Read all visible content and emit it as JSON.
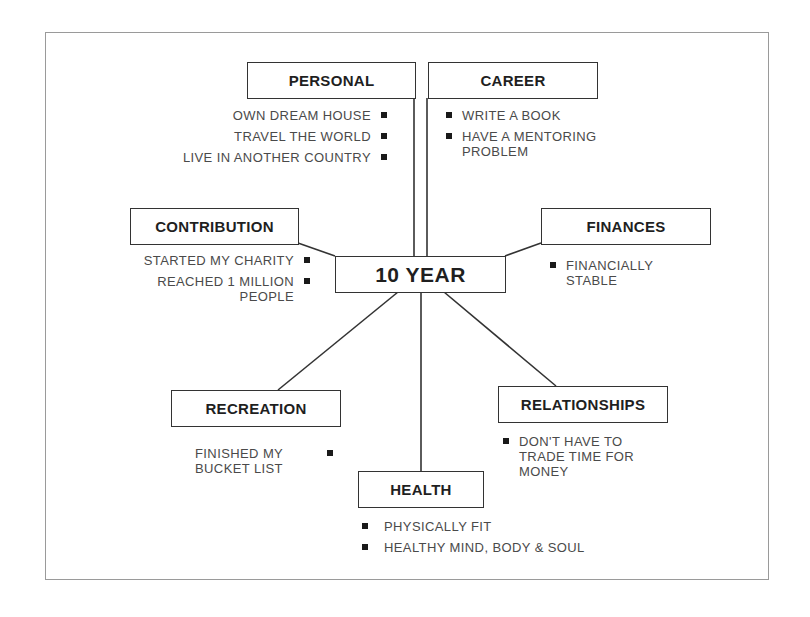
{
  "diagram": {
    "type": "mind-map",
    "center": {
      "label": "10 YEAR"
    },
    "branches": [
      {
        "id": "personal",
        "label": "PERSONAL",
        "items": [
          "OWN DREAM HOUSE",
          "TRAVEL THE WORLD",
          "LIVE IN ANOTHER COUNTRY"
        ]
      },
      {
        "id": "career",
        "label": "CAREER",
        "items": [
          "WRITE A BOOK",
          "HAVE A MENTORING PROBLEM"
        ]
      },
      {
        "id": "contribution",
        "label": "CONTRIBUTION",
        "items": [
          "STARTED MY CHARITY",
          "REACHED 1 MILLION PEOPLE"
        ]
      },
      {
        "id": "finances",
        "label": "FINANCES",
        "items": [
          "FINANCIALLY STABLE"
        ]
      },
      {
        "id": "recreation",
        "label": "RECREATION",
        "items": [
          "FINISHED MY BUCKET LIST"
        ]
      },
      {
        "id": "relationships",
        "label": "RELATIONSHIPS",
        "items": [
          "DON'T HAVE TO TRADE TIME FOR MONEY"
        ]
      },
      {
        "id": "health",
        "label": "HEALTH",
        "items": [
          "PHYSICALLY FIT",
          "HEALTHY MIND, BODY & SOUL"
        ]
      }
    ]
  },
  "colors": {
    "box_border": "#333333",
    "text_heading": "#1f1f1f",
    "text_item": "#4a4a4a",
    "frame_border": "#9a9a9a",
    "bullet": "#1a1a1a"
  }
}
